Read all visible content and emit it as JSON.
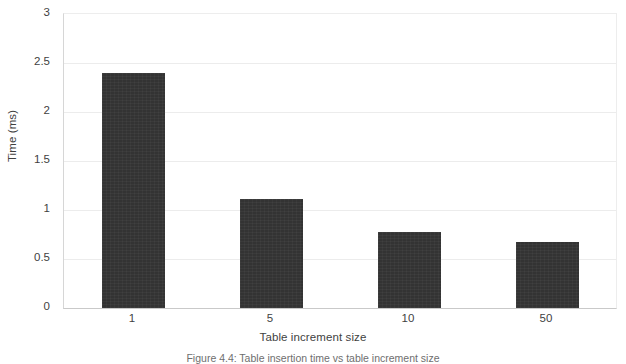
{
  "chart_data": {
    "type": "bar",
    "title": "",
    "categories": [
      "1",
      "5",
      "10",
      "50"
    ],
    "values": [
      2.4,
      1.11,
      0.78,
      0.67
    ],
    "series": [
      {
        "name": "Time (ms)",
        "values": [
          2.4,
          1.11,
          0.78,
          0.67
        ]
      }
    ],
    "xlabel": "Table increment size",
    "ylabel": "Time (ms)",
    "ylim": [
      0,
      3
    ],
    "ytick_values": [
      0,
      0.5,
      1,
      1.5,
      2,
      2.5,
      3
    ],
    "ytick_labels": [
      "0",
      "0.5",
      "1",
      "1.5",
      "2",
      "2.5",
      "3"
    ],
    "grid": true,
    "grid_axis": "y",
    "legend": false,
    "legend_position": "none",
    "bar_color": "#333333",
    "gridline_color": "#ececec",
    "axis_color": "#c9c9c9",
    "background": "#ffffff"
  },
  "caption": {
    "text": "Figure 4.4: Table insertion time vs table increment size"
  }
}
